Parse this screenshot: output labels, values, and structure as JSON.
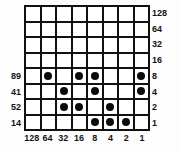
{
  "figure": {
    "grid": {
      "rows": 8,
      "cols": 8
    },
    "colors": {
      "background": "#fdfdfd",
      "cell_background": "#ffffff",
      "grid_line": "#111111",
      "dot": "#0b0b0b",
      "label_text": "#141414"
    }
  },
  "axes": {
    "right_labels": [
      "128",
      "64",
      "32",
      "16",
      "8",
      "4",
      "2",
      "1"
    ],
    "bottom_labels": [
      "128",
      "64",
      "32",
      "16",
      "8",
      "4",
      "2",
      "1"
    ],
    "left_labels": [
      "89",
      "41",
      "52",
      "14"
    ],
    "left_label_rows": [
      5,
      6,
      7,
      8
    ]
  },
  "chart_data": {
    "type": "heatmap",
    "xlabel": "",
    "ylabel": "",
    "categories": [
      "128",
      "64",
      "32",
      "16",
      "8",
      "4",
      "2",
      "1"
    ],
    "row_labels": [
      "128",
      "64",
      "32",
      "16",
      "8",
      "4",
      "2",
      "1"
    ],
    "row_sums": [
      "",
      "",
      "",
      "",
      "89",
      "41",
      "52",
      "14"
    ],
    "grid": [
      [
        0,
        0,
        0,
        0,
        0,
        0,
        0,
        0
      ],
      [
        0,
        0,
        0,
        0,
        0,
        0,
        0,
        0
      ],
      [
        0,
        0,
        0,
        0,
        0,
        0,
        0,
        0
      ],
      [
        0,
        0,
        0,
        0,
        0,
        0,
        0,
        0
      ],
      [
        0,
        1,
        0,
        1,
        1,
        0,
        0,
        1
      ],
      [
        0,
        0,
        1,
        0,
        1,
        0,
        0,
        1
      ],
      [
        0,
        0,
        1,
        1,
        0,
        1,
        0,
        0
      ],
      [
        0,
        0,
        0,
        0,
        1,
        1,
        1,
        0
      ]
    ]
  }
}
